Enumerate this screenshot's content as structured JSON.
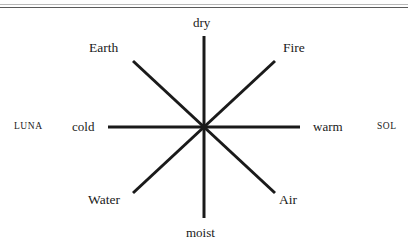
{
  "figure": {
    "caption_rule": "horizontal-rule",
    "diagram_type": "eight-pointed-star",
    "center": {
      "x": 204,
      "y": 127
    },
    "line_color": "#1a1a1a"
  },
  "qualities": {
    "top": "dry",
    "bottom": "moist",
    "left": "cold",
    "right": "warm"
  },
  "elements": {
    "upper_left": "Earth",
    "upper_right": "Fire",
    "lower_left": "Water",
    "lower_right": "Air"
  },
  "luminaries": {
    "left": "LUNA",
    "right": "SOL"
  },
  "rays": [
    {
      "name": "dry-ray",
      "x1": 204,
      "y1": 127,
      "x2": 204,
      "y2": 36
    },
    {
      "name": "moist-ray",
      "x1": 204,
      "y1": 127,
      "x2": 204,
      "y2": 218
    },
    {
      "name": "cold-ray",
      "x1": 204,
      "y1": 127,
      "x2": 108,
      "y2": 127
    },
    {
      "name": "warm-ray",
      "x1": 204,
      "y1": 127,
      "x2": 300,
      "y2": 127
    },
    {
      "name": "earth-ray",
      "x1": 204,
      "y1": 127,
      "x2": 133,
      "y2": 61
    },
    {
      "name": "fire-ray",
      "x1": 204,
      "y1": 127,
      "x2": 275,
      "y2": 61
    },
    {
      "name": "water-ray",
      "x1": 204,
      "y1": 127,
      "x2": 133,
      "y2": 193
    },
    {
      "name": "air-ray",
      "x1": 204,
      "y1": 127,
      "x2": 275,
      "y2": 193
    }
  ]
}
